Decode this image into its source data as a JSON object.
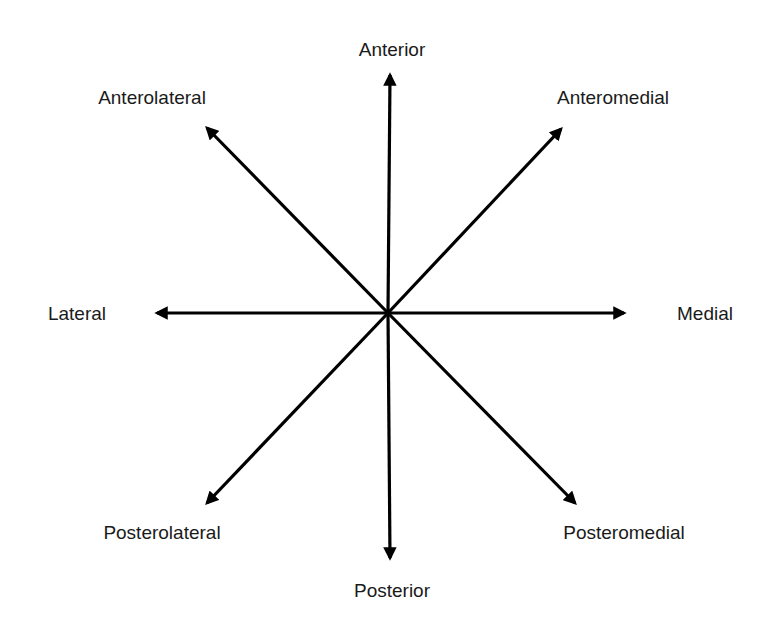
{
  "colors": {
    "arrow": "#000000",
    "text": "#1a1a1a",
    "background": "#ffffff"
  },
  "center": {
    "x": 388,
    "y": 313
  },
  "directions": [
    {
      "key": "anterior",
      "label": "Anterior",
      "tip": [
        390,
        75
      ],
      "label_pos": [
        392,
        49
      ]
    },
    {
      "key": "anteromedial",
      "label": "Anteromedial",
      "tip": [
        561,
        129
      ],
      "label_pos": [
        613,
        97
      ]
    },
    {
      "key": "medial",
      "label": "Medial",
      "tip": [
        624,
        313
      ],
      "label_pos": [
        705,
        313
      ]
    },
    {
      "key": "posteromedial",
      "label": "Posteromedial",
      "tip": [
        575,
        503
      ],
      "label_pos": [
        624,
        532
      ]
    },
    {
      "key": "posterior",
      "label": "Posterior",
      "tip": [
        390,
        558
      ],
      "label_pos": [
        392,
        590
      ]
    },
    {
      "key": "posterolateral",
      "label": "Posterolateral",
      "tip": [
        207,
        503
      ],
      "label_pos": [
        162,
        532
      ]
    },
    {
      "key": "lateral",
      "label": "Lateral",
      "tip": [
        157,
        313
      ],
      "label_pos": [
        77,
        313
      ]
    },
    {
      "key": "anterolateral",
      "label": "Anterolateral",
      "tip": [
        207,
        128
      ],
      "label_pos": [
        152,
        97
      ]
    }
  ]
}
